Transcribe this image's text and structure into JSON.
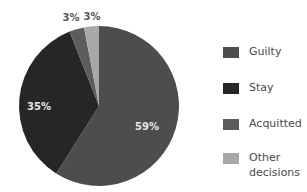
{
  "chart_data": {
    "type": "pie",
    "title": "",
    "categories": [
      "Guilty",
      "Stay",
      "Acquitted",
      "Other decisions"
    ],
    "values": [
      59,
      35,
      3,
      3
    ],
    "labels": [
      "59%",
      "35%",
      "3%",
      "3%"
    ],
    "colors": [
      "#4d4d4d",
      "#262626",
      "#5c5c5c",
      "#a8a8a8"
    ],
    "start_angle": "12 o'clock",
    "direction": "clockwise",
    "legend_position": "right"
  },
  "legend": {
    "items": [
      {
        "label": "Guilty",
        "color": "#4d4d4d"
      },
      {
        "label": "Stay",
        "color": "#262626"
      },
      {
        "label": "Acquitted",
        "color": "#5c5c5c"
      },
      {
        "label": "Other decisions",
        "color": "#a8a8a8"
      }
    ]
  },
  "colors": {
    "inside_label": "#e8e8e8",
    "outside_label": "#555555",
    "background": "#ffffff"
  }
}
